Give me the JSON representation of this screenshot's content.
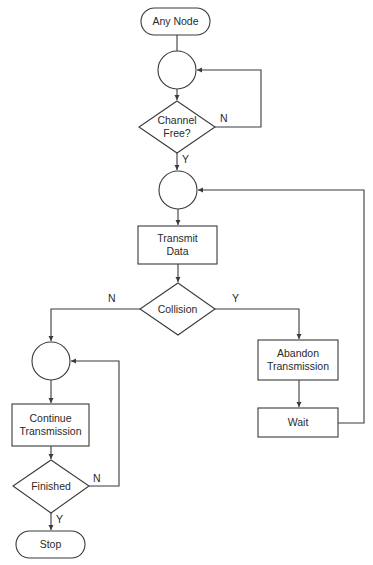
{
  "diagram": {
    "type": "flowchart",
    "title": "",
    "nodes": [
      {
        "id": "any_node",
        "shape": "terminal",
        "label": "Any Node"
      },
      {
        "id": "junction1",
        "shape": "connector",
        "label": ""
      },
      {
        "id": "channel_free",
        "shape": "decision",
        "label_line1": "Channel",
        "label_line2": "Free?"
      },
      {
        "id": "junction2",
        "shape": "connector",
        "label": ""
      },
      {
        "id": "transmit_data",
        "shape": "process",
        "label_line1": "Transmit",
        "label_line2": "Data"
      },
      {
        "id": "collision",
        "shape": "decision",
        "label": "Collision"
      },
      {
        "id": "junction3",
        "shape": "connector",
        "label": ""
      },
      {
        "id": "continue_transmission",
        "shape": "process",
        "label_line1": "Continue",
        "label_line2": "Transmission"
      },
      {
        "id": "finished",
        "shape": "decision",
        "label": "Finished"
      },
      {
        "id": "stop",
        "shape": "terminal",
        "label": "Stop"
      },
      {
        "id": "abandon_transmission",
        "shape": "process",
        "label_line1": "Abandon",
        "label_line2": "Transmission"
      },
      {
        "id": "wait",
        "shape": "process",
        "label": "Wait"
      }
    ],
    "edges": [
      {
        "from": "any_node",
        "to": "junction1",
        "label": ""
      },
      {
        "from": "junction1",
        "to": "channel_free",
        "label": ""
      },
      {
        "from": "channel_free",
        "to": "junction1",
        "label": "N"
      },
      {
        "from": "channel_free",
        "to": "junction2",
        "label": "Y"
      },
      {
        "from": "junction2",
        "to": "transmit_data",
        "label": ""
      },
      {
        "from": "transmit_data",
        "to": "collision",
        "label": ""
      },
      {
        "from": "collision",
        "to": "junction3",
        "label": "N"
      },
      {
        "from": "collision",
        "to": "abandon_transmission",
        "label": "Y"
      },
      {
        "from": "junction3",
        "to": "continue_transmission",
        "label": ""
      },
      {
        "from": "continue_transmission",
        "to": "finished",
        "label": ""
      },
      {
        "from": "finished",
        "to": "junction3",
        "label": "N"
      },
      {
        "from": "finished",
        "to": "stop",
        "label": "Y"
      },
      {
        "from": "abandon_transmission",
        "to": "wait",
        "label": ""
      },
      {
        "from": "wait",
        "to": "junction2",
        "label": ""
      }
    ],
    "edge_labels": {
      "channel_no": "N",
      "channel_yes": "Y",
      "collision_no": "N",
      "collision_yes": "Y",
      "finished_no": "N",
      "finished_yes": "Y"
    }
  },
  "colors": {
    "stroke": "#3a3a3a",
    "background": "#ffffff",
    "text": "#2a2a2a"
  }
}
